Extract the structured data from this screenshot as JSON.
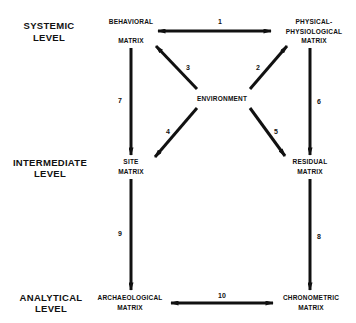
{
  "levels": [
    {
      "line1": "SYSTEMIC",
      "line2": "LEVEL"
    },
    {
      "line1": "INTERMEDIATE",
      "line2": "LEVEL"
    },
    {
      "line1": "ANALYTICAL",
      "line2": "LEVEL"
    }
  ],
  "nodes": {
    "behavioral": {
      "line1": "BEHAVIORAL",
      "line2": "MATRIX"
    },
    "physical": {
      "line1": "PHYSICAL-",
      "line2": "PHYSIOLOGICAL",
      "line3": "MATRIX"
    },
    "environment": {
      "line1": "ENVIRONMENT"
    },
    "site": {
      "line1": "SITE",
      "line2": "MATRIX"
    },
    "residual": {
      "line1": "RESIDUAL",
      "line2": "MATRIX"
    },
    "archaeological": {
      "line1": "ARCHAEOLOGICAL",
      "line2": "MATRIX"
    },
    "chronometric": {
      "line1": "CHRONOMETRIC",
      "line2": "MATRIX"
    }
  },
  "arrows": [
    {
      "id": "1",
      "from": "behavioral",
      "to": "physical",
      "direction": "both"
    },
    {
      "id": "2",
      "from": "environment",
      "to": "physical",
      "direction": "forward"
    },
    {
      "id": "3",
      "from": "environment",
      "to": "behavioral",
      "direction": "forward"
    },
    {
      "id": "4",
      "from": "environment",
      "to": "site",
      "direction": "forward"
    },
    {
      "id": "5",
      "from": "environment",
      "to": "residual",
      "direction": "forward"
    },
    {
      "id": "6",
      "from": "physical",
      "to": "residual",
      "direction": "forward"
    },
    {
      "id": "7",
      "from": "behavioral",
      "to": "site",
      "direction": "forward"
    },
    {
      "id": "8",
      "from": "residual",
      "to": "chronometric",
      "direction": "forward"
    },
    {
      "id": "9",
      "from": "site",
      "to": "archaeological",
      "direction": "forward"
    },
    {
      "id": "10",
      "from": "archaeological",
      "to": "chronometric",
      "direction": "both"
    }
  ],
  "colors": {
    "ink": "#111111",
    "background": "#ffffff"
  }
}
